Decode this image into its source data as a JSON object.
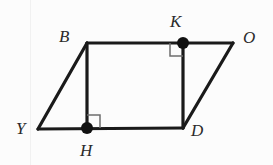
{
  "figure": {
    "background_color": "#fcfcfc",
    "stroke_color": "#1a1a1a",
    "label_color": "#2b2b2b",
    "mark_color": "#6e6e6e",
    "vertices": {
      "Y": {
        "label": "Y",
        "x": 38,
        "y": 129,
        "label_x": 16,
        "label_y": 120
      },
      "B": {
        "label": "B",
        "x": 87,
        "y": 43,
        "label_x": 59,
        "label_y": 28
      },
      "O": {
        "label": "O",
        "x": 233,
        "y": 43,
        "label_x": 243,
        "label_y": 29
      },
      "D": {
        "label": "D",
        "x": 183,
        "y": 128,
        "label_x": 191,
        "label_y": 122
      },
      "H": {
        "label": "H",
        "x": 87,
        "y": 128,
        "label_x": 80,
        "label_y": 142
      },
      "K": {
        "label": "K",
        "x": 183,
        "y": 43,
        "label_x": 170,
        "label_y": 13
      }
    },
    "edges": [
      {
        "name": "edge-Y-B",
        "from": "Y",
        "to": "B"
      },
      {
        "name": "edge-B-O",
        "from": "B",
        "to": "O"
      },
      {
        "name": "edge-O-D",
        "from": "O",
        "to": "D"
      },
      {
        "name": "edge-D-Y",
        "from": "D",
        "to": "Y"
      },
      {
        "name": "segment-B-H",
        "from": "B",
        "to": "H"
      },
      {
        "name": "segment-K-D",
        "from": "K",
        "to": "D"
      }
    ],
    "marked_points": [
      {
        "name": "point-H",
        "at": "H"
      },
      {
        "name": "point-K",
        "at": "K"
      }
    ],
    "right_angle_marks": [
      {
        "name": "right-angle-at-H",
        "at": "H",
        "dx": 1,
        "dy": -1,
        "size": 13
      },
      {
        "name": "right-angle-at-K",
        "at": "K",
        "dx": -1,
        "dy": 1,
        "size": 13
      }
    ],
    "paper_streaks": [
      {
        "x": 30,
        "opacity": 0.045
      }
    ]
  }
}
